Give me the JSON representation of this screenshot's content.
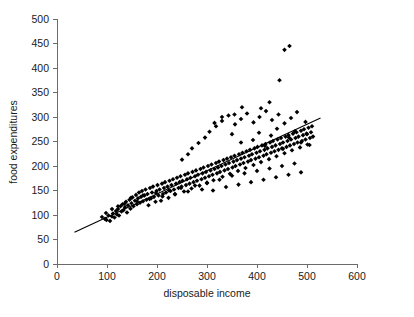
{
  "chart_data": {
    "type": "scatter",
    "title": "",
    "xlabel": "disposable income",
    "ylabel": "food expenditures",
    "xlim": [
      0,
      600
    ],
    "ylim": [
      0,
      500
    ],
    "xticks": [
      0,
      100,
      200,
      300,
      400,
      500,
      600
    ],
    "yticks": [
      0,
      50,
      100,
      150,
      200,
      250,
      300,
      350,
      400,
      450,
      500
    ],
    "grid": false,
    "legend": null,
    "marker": "diamond",
    "marker_color": "#000000",
    "fit_line": {
      "label": "linear regression line",
      "color": "#000000",
      "x_start": 35,
      "y_start": 65,
      "x_end": 527,
      "y_end": 298,
      "slope": 0.474,
      "intercept": 48.4
    },
    "points": [
      [
        90,
        96
      ],
      [
        96,
        92
      ],
      [
        99,
        90
      ],
      [
        103,
        99
      ],
      [
        106,
        88
      ],
      [
        110,
        97
      ],
      [
        112,
        103
      ],
      [
        115,
        95
      ],
      [
        118,
        108
      ],
      [
        120,
        101
      ],
      [
        122,
        112
      ],
      [
        124,
        99
      ],
      [
        127,
        118
      ],
      [
        129,
        107
      ],
      [
        131,
        122
      ],
      [
        133,
        110
      ],
      [
        136,
        116
      ],
      [
        138,
        127
      ],
      [
        140,
        105
      ],
      [
        142,
        120
      ],
      [
        145,
        131
      ],
      [
        147,
        113
      ],
      [
        149,
        124
      ],
      [
        151,
        136
      ],
      [
        153,
        118
      ],
      [
        156,
        129
      ],
      [
        158,
        141
      ],
      [
        160,
        122
      ],
      [
        162,
        134
      ],
      [
        164,
        146
      ],
      [
        166,
        125
      ],
      [
        168,
        137
      ],
      [
        170,
        149
      ],
      [
        172,
        128
      ],
      [
        175,
        140
      ],
      [
        177,
        152
      ],
      [
        179,
        131
      ],
      [
        181,
        143
      ],
      [
        183,
        120
      ],
      [
        186,
        155
      ],
      [
        188,
        134
      ],
      [
        190,
        146
      ],
      [
        192,
        158
      ],
      [
        194,
        137
      ],
      [
        197,
        127
      ],
      [
        199,
        149
      ],
      [
        201,
        161
      ],
      [
        203,
        140
      ],
      [
        205,
        152
      ],
      [
        208,
        129
      ],
      [
        210,
        164
      ],
      [
        212,
        143
      ],
      [
        214,
        155
      ],
      [
        216,
        167
      ],
      [
        218,
        146
      ],
      [
        221,
        158
      ],
      [
        223,
        135
      ],
      [
        225,
        170
      ],
      [
        227,
        149
      ],
      [
        229,
        161
      ],
      [
        232,
        173
      ],
      [
        234,
        152
      ],
      [
        236,
        142
      ],
      [
        238,
        164
      ],
      [
        240,
        176
      ],
      [
        243,
        155
      ],
      [
        245,
        167
      ],
      [
        247,
        179
      ],
      [
        249,
        158
      ],
      [
        251,
        170
      ],
      [
        254,
        148
      ],
      [
        256,
        182
      ],
      [
        258,
        161
      ],
      [
        260,
        173
      ],
      [
        262,
        185
      ],
      [
        265,
        164
      ],
      [
        267,
        176
      ],
      [
        269,
        154
      ],
      [
        271,
        188
      ],
      [
        273,
        167
      ],
      [
        276,
        179
      ],
      [
        278,
        191
      ],
      [
        280,
        170
      ],
      [
        282,
        182
      ],
      [
        285,
        160
      ],
      [
        287,
        194
      ],
      [
        289,
        173
      ],
      [
        291,
        185
      ],
      [
        293,
        197
      ],
      [
        296,
        176
      ],
      [
        298,
        188
      ],
      [
        300,
        166
      ],
      [
        302,
        200
      ],
      [
        304,
        179
      ],
      [
        307,
        191
      ],
      [
        309,
        203
      ],
      [
        311,
        182
      ],
      [
        313,
        171
      ],
      [
        315,
        194
      ],
      [
        318,
        206
      ],
      [
        320,
        185
      ],
      [
        322,
        197
      ],
      [
        324,
        209
      ],
      [
        326,
        188
      ],
      [
        329,
        200
      ],
      [
        331,
        178
      ],
      [
        333,
        212
      ],
      [
        335,
        191
      ],
      [
        337,
        203
      ],
      [
        340,
        215
      ],
      [
        342,
        194
      ],
      [
        344,
        206
      ],
      [
        346,
        184
      ],
      [
        348,
        218
      ],
      [
        351,
        197
      ],
      [
        353,
        209
      ],
      [
        355,
        221
      ],
      [
        357,
        200
      ],
      [
        360,
        212
      ],
      [
        362,
        190
      ],
      [
        364,
        224
      ],
      [
        366,
        203
      ],
      [
        368,
        215
      ],
      [
        371,
        227
      ],
      [
        373,
        206
      ],
      [
        375,
        218
      ],
      [
        377,
        196
      ],
      [
        379,
        230
      ],
      [
        382,
        209
      ],
      [
        384,
        221
      ],
      [
        386,
        233
      ],
      [
        388,
        212
      ],
      [
        390,
        224
      ],
      [
        393,
        202
      ],
      [
        395,
        236
      ],
      [
        397,
        215
      ],
      [
        399,
        227
      ],
      [
        401,
        239
      ],
      [
        404,
        218
      ],
      [
        406,
        230
      ],
      [
        408,
        208
      ],
      [
        410,
        242
      ],
      [
        413,
        221
      ],
      [
        415,
        233
      ],
      [
        417,
        245
      ],
      [
        419,
        224
      ],
      [
        421,
        236
      ],
      [
        424,
        214
      ],
      [
        426,
        248
      ],
      [
        428,
        227
      ],
      [
        430,
        239
      ],
      [
        432,
        251
      ],
      [
        435,
        230
      ],
      [
        437,
        242
      ],
      [
        439,
        220
      ],
      [
        441,
        254
      ],
      [
        443,
        233
      ],
      [
        446,
        245
      ],
      [
        448,
        257
      ],
      [
        450,
        236
      ],
      [
        452,
        248
      ],
      [
        455,
        226
      ],
      [
        457,
        260
      ],
      [
        459,
        239
      ],
      [
        461,
        251
      ],
      [
        463,
        263
      ],
      [
        466,
        242
      ],
      [
        468,
        254
      ],
      [
        470,
        232
      ],
      [
        472,
        266
      ],
      [
        474,
        245
      ],
      [
        477,
        257
      ],
      [
        479,
        269
      ],
      [
        481,
        248
      ],
      [
        483,
        260
      ],
      [
        486,
        238
      ],
      [
        488,
        272
      ],
      [
        490,
        251
      ],
      [
        492,
        263
      ],
      [
        494,
        275
      ],
      [
        497,
        254
      ],
      [
        499,
        266
      ],
      [
        501,
        244
      ],
      [
        503,
        278
      ],
      [
        506,
        257
      ],
      [
        508,
        269
      ],
      [
        510,
        281
      ],
      [
        512,
        260
      ],
      [
        250,
        213
      ],
      [
        262,
        224
      ],
      [
        270,
        236
      ],
      [
        283,
        247
      ],
      [
        296,
        258
      ],
      [
        305,
        270
      ],
      [
        318,
        281
      ],
      [
        330,
        292
      ],
      [
        343,
        303
      ],
      [
        356,
        285
      ],
      [
        368,
        296
      ],
      [
        380,
        307
      ],
      [
        393,
        289
      ],
      [
        405,
        300
      ],
      [
        418,
        312
      ],
      [
        430,
        294
      ],
      [
        443,
        305
      ],
      [
        455,
        287
      ],
      [
        468,
        298
      ],
      [
        480,
        310
      ],
      [
        300,
        165
      ],
      [
        312,
        150
      ],
      [
        325,
        172
      ],
      [
        338,
        157
      ],
      [
        350,
        180
      ],
      [
        363,
        162
      ],
      [
        375,
        185
      ],
      [
        388,
        167
      ],
      [
        400,
        190
      ],
      [
        413,
        172
      ],
      [
        425,
        195
      ],
      [
        438,
        177
      ],
      [
        450,
        200
      ],
      [
        463,
        182
      ],
      [
        475,
        205
      ],
      [
        488,
        187
      ],
      [
        392,
        253
      ],
      [
        404,
        268
      ],
      [
        416,
        241
      ],
      [
        428,
        262
      ],
      [
        440,
        276
      ],
      [
        452,
        235
      ],
      [
        464,
        258
      ],
      [
        476,
        271
      ],
      [
        488,
        248
      ],
      [
        500,
        265
      ],
      [
        497,
        290
      ],
      [
        505,
        243
      ],
      [
        445,
        375
      ],
      [
        455,
        437
      ],
      [
        465,
        445
      ],
      [
        425,
        330
      ],
      [
        408,
        318
      ],
      [
        370,
        320
      ],
      [
        355,
        305
      ],
      [
        330,
        300
      ],
      [
        315,
        288
      ],
      [
        350,
        265
      ],
      [
        368,
        248
      ],
      [
        290,
        152
      ],
      [
        276,
        160
      ],
      [
        262,
        148
      ],
      [
        248,
        155
      ],
      [
        236,
        143
      ],
      [
        224,
        150
      ],
      [
        211,
        138
      ],
      [
        198,
        145
      ],
      [
        185,
        133
      ],
      [
        172,
        140
      ],
      [
        160,
        128
      ],
      [
        148,
        135
      ],
      [
        135,
        123
      ],
      [
        122,
        118
      ],
      [
        110,
        112
      ],
      [
        98,
        104
      ]
    ]
  },
  "axis_labels": {
    "x_title": "disposable income",
    "y_title": "food expenditures"
  }
}
